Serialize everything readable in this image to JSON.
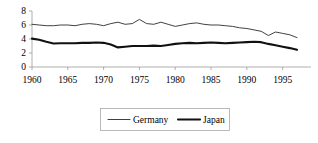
{
  "chart_data": {
    "type": "line",
    "title": "",
    "subtitle": "",
    "xlabel": "",
    "ylabel": "",
    "xlim": [
      1960,
      1997
    ],
    "ylim": [
      0,
      8
    ],
    "grid": false,
    "legend_position": "bottom",
    "x": [
      1960,
      1961,
      1962,
      1963,
      1964,
      1965,
      1966,
      1967,
      1968,
      1969,
      1970,
      1971,
      1972,
      1973,
      1974,
      1975,
      1976,
      1977,
      1978,
      1979,
      1980,
      1981,
      1982,
      1983,
      1984,
      1985,
      1986,
      1987,
      1988,
      1989,
      1990,
      1991,
      1992,
      1993,
      1994,
      1995,
      1996,
      1997
    ],
    "xticks": [
      1960,
      1965,
      1970,
      1975,
      1980,
      1985,
      1990,
      1995
    ],
    "xticklabels": [
      "1960",
      "1965",
      "1970",
      "1975",
      "1980",
      "1985",
      "1990",
      "1995"
    ],
    "yticks": [
      0,
      2,
      4,
      6,
      8
    ],
    "yticklabels": [
      "0",
      "2",
      "4",
      "6",
      "8"
    ],
    "series": [
      {
        "name": "Germany",
        "color": "#2b2b2b",
        "line_width": "thin",
        "values": [
          6.1,
          6.0,
          5.9,
          5.9,
          6.0,
          6.0,
          5.9,
          6.1,
          6.2,
          6.1,
          5.9,
          6.2,
          6.4,
          6.1,
          6.2,
          6.8,
          6.2,
          6.1,
          6.4,
          6.1,
          5.8,
          6.0,
          6.2,
          6.3,
          6.1,
          6.0,
          6.0,
          5.9,
          5.8,
          5.6,
          5.5,
          5.3,
          5.1,
          4.5,
          5.0,
          4.8,
          4.6,
          4.2
        ]
      },
      {
        "name": "Japan",
        "color": "#111111",
        "line_width": "thick",
        "values": [
          4.05,
          3.9,
          3.6,
          3.35,
          3.4,
          3.4,
          3.4,
          3.45,
          3.45,
          3.5,
          3.45,
          3.2,
          2.8,
          2.9,
          3.0,
          3.0,
          3.0,
          3.05,
          3.0,
          3.15,
          3.3,
          3.4,
          3.45,
          3.4,
          3.45,
          3.5,
          3.45,
          3.4,
          3.45,
          3.5,
          3.55,
          3.6,
          3.55,
          3.3,
          3.1,
          2.9,
          2.7,
          2.45
        ]
      }
    ],
    "legend": [
      {
        "label": "Germany",
        "style": "thin-line"
      },
      {
        "label": "Japan",
        "style": "thick-line"
      }
    ]
  },
  "colors": {
    "background": "#ffffff",
    "axis": "#9a9a9a",
    "germany": "#2b2b2b",
    "japan": "#111111",
    "legend_border": "#a8a8a8"
  }
}
